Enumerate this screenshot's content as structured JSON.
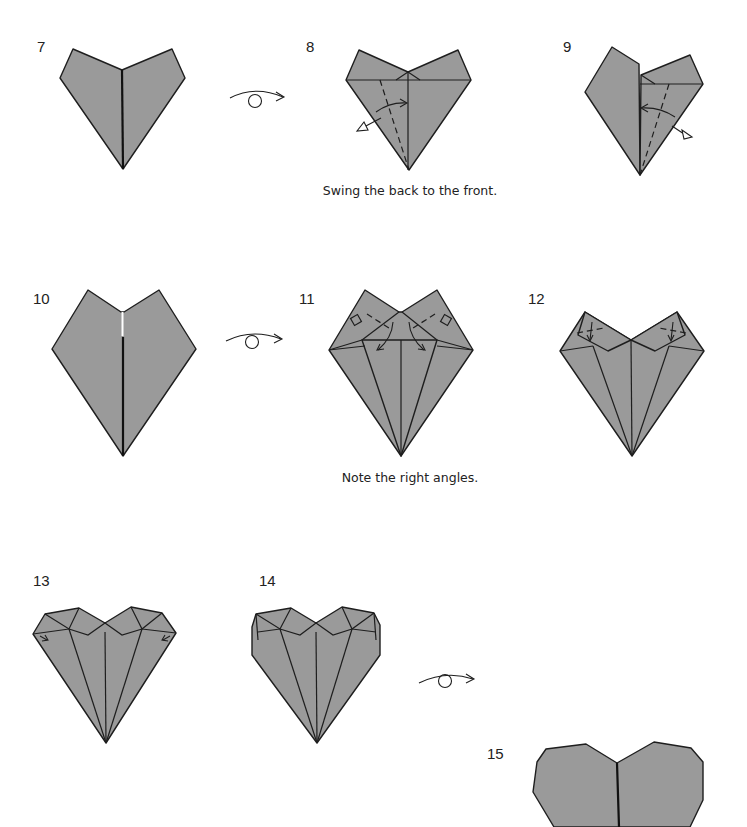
{
  "diagram": {
    "type": "origami-instructions",
    "paper_color": "#9a9a9a",
    "line_color": "#1e1e1e",
    "steps": [
      {
        "number": "7",
        "caption": ""
      },
      {
        "number": "8",
        "caption": "Swing the back to the front."
      },
      {
        "number": "9",
        "caption": ""
      },
      {
        "number": "10",
        "caption": ""
      },
      {
        "number": "11",
        "caption": "Note the right angles."
      },
      {
        "number": "12",
        "caption": ""
      },
      {
        "number": "13",
        "caption": ""
      },
      {
        "number": "14",
        "caption": ""
      },
      {
        "number": "15",
        "caption": ""
      }
    ],
    "symbols": [
      {
        "name": "turn-over-icon",
        "after_step": "7"
      },
      {
        "name": "turn-over-icon",
        "after_step": "10"
      },
      {
        "name": "turn-over-icon",
        "after_step": "14"
      }
    ]
  }
}
